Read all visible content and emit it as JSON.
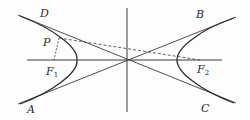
{
  "diagram": {
    "type": "hyperbola-with-asymptotes",
    "colors": {
      "stroke": "#3a3a3a",
      "background": "#fdfdfd"
    },
    "labels": {
      "D": "D",
      "B": "B",
      "A": "A",
      "C": "C",
      "P": "P",
      "F1": "F",
      "F1_sub": "1",
      "F2": "F",
      "F2_sub": "2"
    },
    "elements": {
      "axes": [
        "horizontal axis",
        "vertical axis"
      ],
      "asymptotes": [
        "line DC",
        "line AB"
      ],
      "branches": [
        "left branch",
        "right branch"
      ],
      "dashed_segments": [
        "P to F1",
        "P to F2"
      ]
    }
  }
}
